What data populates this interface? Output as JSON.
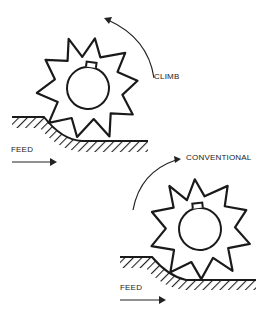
{
  "diagram": {
    "top": {
      "direction_label": "CLIMB",
      "feed_label": "FEED"
    },
    "bottom": {
      "direction_label": "CONVENTIONAL",
      "feed_label": "FEED"
    }
  }
}
